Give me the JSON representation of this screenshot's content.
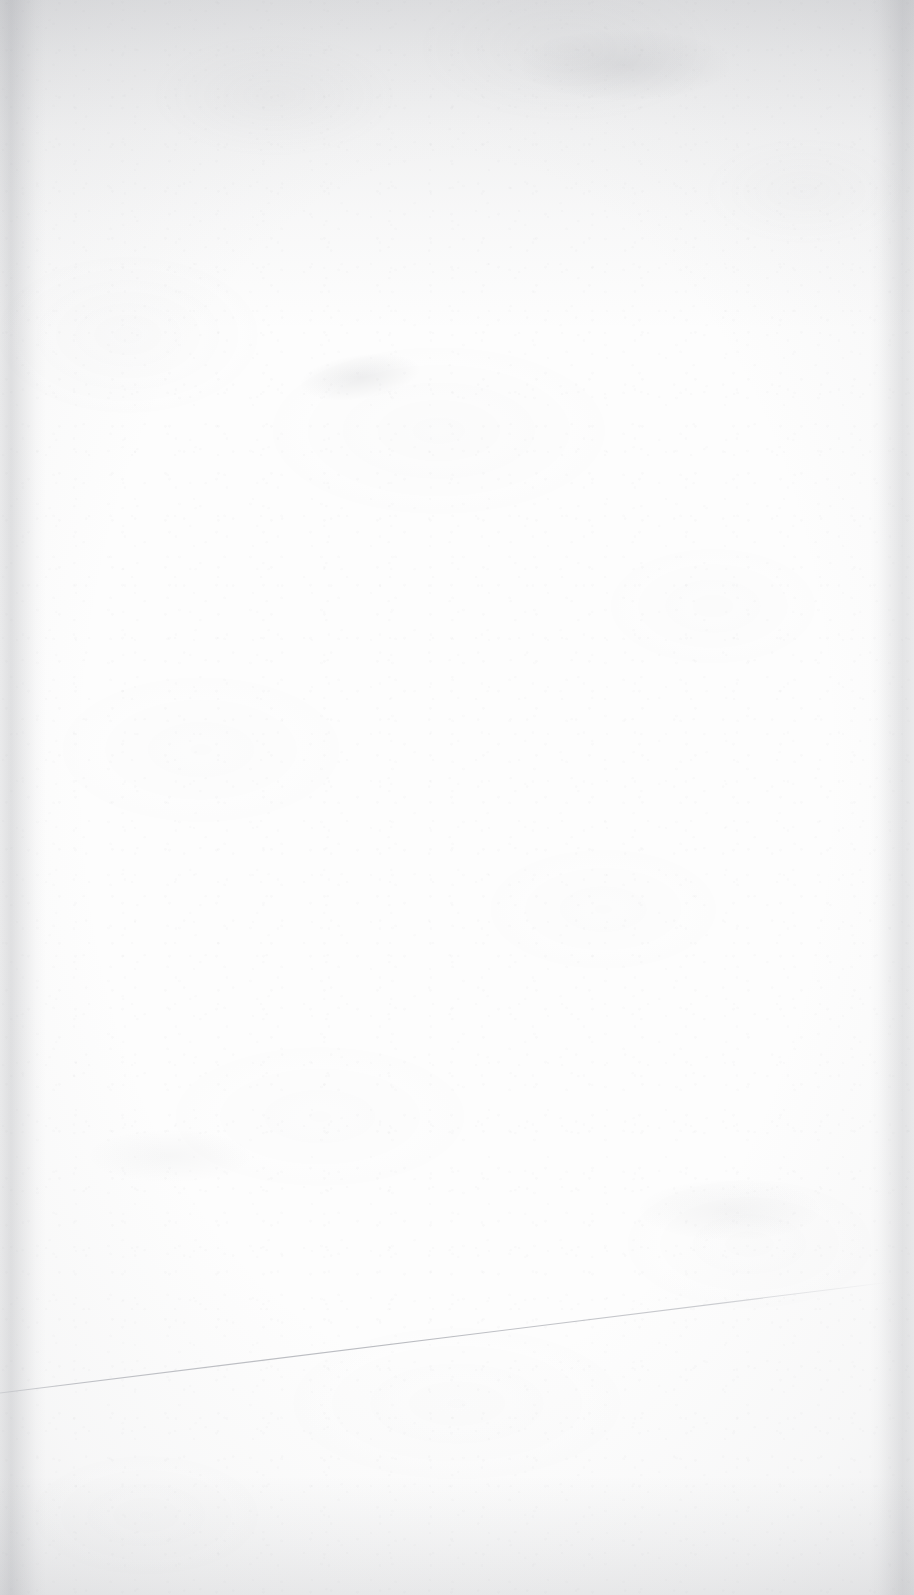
{
  "page": {
    "kind": "scanned-document-page",
    "state": "blank",
    "width": 914,
    "height": 1595,
    "visible_text": "",
    "text_blocks": [],
    "headings": [],
    "page_number": "",
    "colors": {
      "paper": "#fdfdfd",
      "paper_shadow": "#9294 9a",
      "edge_shadow": "#92949a",
      "hairline": "#b9bbc0"
    }
  },
  "marks": {
    "hairline": {
      "name": "sheet-edge-hairline",
      "description": "faint diagonal scan line near lower page",
      "x1": 0,
      "y1": 1393,
      "x2": 891,
      "y2": 1282,
      "color": "#b9bbc0",
      "stroke_width": 1
    },
    "smudges": [
      {
        "name": "smudge-upper-center",
        "x": 300,
        "y": 355
      },
      {
        "name": "smudge-top-band",
        "x": 520,
        "y": 30
      },
      {
        "name": "smudge-lower-right",
        "x": 640,
        "y": 1180
      },
      {
        "name": "smudge-lower-left",
        "x": 90,
        "y": 1130
      }
    ]
  },
  "vignette": {
    "top_label": "top-edge-shadow",
    "left_label": "left-edge-shadow",
    "right_label": "right-edge-shadow",
    "bottom_label": "bottom-edge-shadow"
  }
}
